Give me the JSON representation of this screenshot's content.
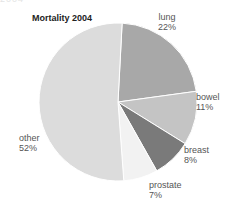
{
  "header_fragment": "2004",
  "chart_data": {
    "type": "pie",
    "title": "Mortality 2004",
    "categories": [
      "lung",
      "bowel",
      "breast",
      "prostate",
      "other"
    ],
    "values": [
      22,
      11,
      8,
      7,
      52
    ],
    "value_labels": [
      "22%",
      "11%",
      "8%",
      "7%",
      "52%"
    ],
    "colors": [
      "#a8a8a8",
      "#c4c4c4",
      "#7a7a7a",
      "#f2f2f2",
      "#dcdcdc"
    ],
    "start_angle_deg": 3,
    "direction": "clockwise",
    "legend": "none",
    "center": [
      118,
      102
    ],
    "radius": 79
  }
}
